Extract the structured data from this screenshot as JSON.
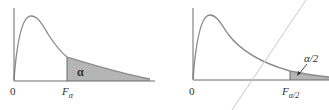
{
  "figure": {
    "colors": {
      "axis": "#6b6b6b",
      "curve": "#8a8a8a",
      "shade": "#b5b5b5",
      "text": "#333333",
      "diagonal": "#c8c8c8"
    },
    "left_panel": {
      "origin_label": "0",
      "critical_label": "F",
      "critical_sub": "α",
      "area_label": "α"
    },
    "right_panel": {
      "origin_label": "0",
      "critical_label": "F",
      "critical_sub": "α/2",
      "area_label": "α/2"
    }
  }
}
